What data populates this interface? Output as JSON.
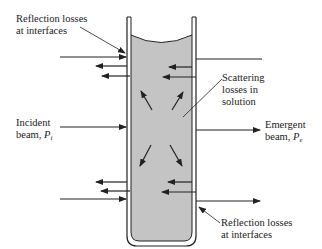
{
  "labels": {
    "reflection_top_line1": "Reflection losses",
    "reflection_top_line2": "at interfaces",
    "scattering_line1": "Scattering",
    "scattering_line2": "losses in",
    "scattering_line3": "solution",
    "incident_line1": "Incident",
    "incident_line2": "beam, ",
    "incident_symbol": "P",
    "incident_sub": "i",
    "emergent_line1": "Emergent",
    "emergent_line2": "beam, ",
    "emergent_symbol": "P",
    "emergent_sub": "e",
    "reflection_bottom_line1": "Reflection losses",
    "reflection_bottom_line2": "at interfaces"
  },
  "colors": {
    "solution": "#c4c4c4",
    "stroke": "#222222"
  }
}
